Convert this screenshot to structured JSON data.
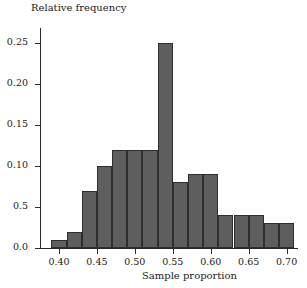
{
  "chart_data": {
    "type": "bar",
    "title": "",
    "ylabel": "Relative frequency",
    "xlabel": "Sample proportion",
    "grid": false,
    "legend": null,
    "bin_width": 0.02,
    "xlim": [
      0.375,
      0.715
    ],
    "ylim": [
      0.0,
      0.268
    ],
    "categories": [
      "0.39-0.41",
      "0.41-0.43",
      "0.43-0.45",
      "0.45-0.47",
      "0.47-0.49",
      "0.49-0.51",
      "0.51-0.53",
      "0.53-0.55",
      "0.55-0.57",
      "0.57-0.59",
      "0.59-0.61",
      "0.61-0.63",
      "0.63-0.65",
      "0.65-0.67",
      "0.67-0.69",
      "0.69-0.71"
    ],
    "bin_starts": [
      0.39,
      0.41,
      0.43,
      0.45,
      0.47,
      0.49,
      0.51,
      0.53,
      0.55,
      0.57,
      0.59,
      0.61,
      0.63,
      0.65,
      0.67,
      0.69
    ],
    "values": [
      0.01,
      0.02,
      0.07,
      0.1,
      0.12,
      0.12,
      0.12,
      0.25,
      0.08,
      0.09,
      0.09,
      0.04,
      0.04,
      0.04,
      0.03,
      0.03
    ],
    "ytick_values": [
      0.0,
      0.05,
      0.1,
      0.15,
      0.2,
      0.25
    ],
    "ytick_labels": [
      "0.0",
      "0.5",
      "0.10",
      "0.15",
      "0.20",
      "0.25"
    ],
    "xtick_values": [
      0.4,
      0.45,
      0.5,
      0.55,
      0.6,
      0.65,
      0.7
    ],
    "xtick_labels": [
      "0.40",
      "0.45",
      "0.50",
      "0.55",
      "0.60",
      "0.65",
      "0.70"
    ],
    "bar_color": "#5e5e5e",
    "bar_edge_color": "#2e2e2e",
    "axis_color": "#2b2b2b"
  }
}
